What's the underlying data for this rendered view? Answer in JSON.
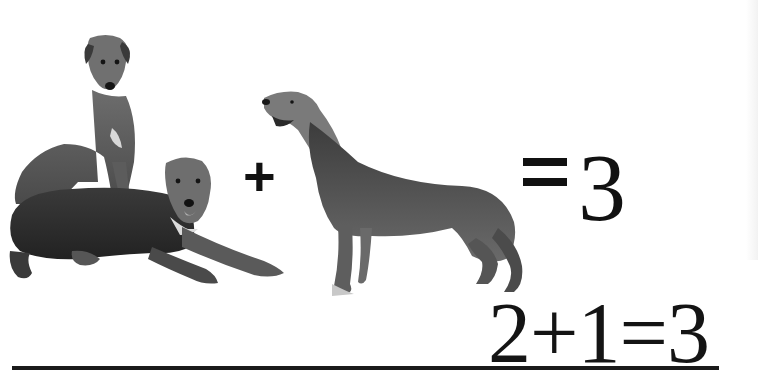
{
  "scene": {
    "description": "Three Irish Wolfhounds illustrating addition",
    "left_group": {
      "label": "two wolfhounds",
      "count": 2,
      "dogs": [
        "sitting wolfhound",
        "lying wolfhound"
      ]
    },
    "right_group": {
      "label": "one standing wolfhound",
      "count": 1
    }
  },
  "visual_equation": {
    "plus": "+",
    "equals_result": "= 3"
  },
  "caption_equation": {
    "text": "2+1=3",
    "underlined": true
  },
  "colors": {
    "background": "#ffffff",
    "ink": "#111111",
    "dog_fur_dark": "#2b2b2b",
    "dog_fur_mid": "#6a6a6a",
    "dog_fur_light": "#a8a8a8"
  }
}
